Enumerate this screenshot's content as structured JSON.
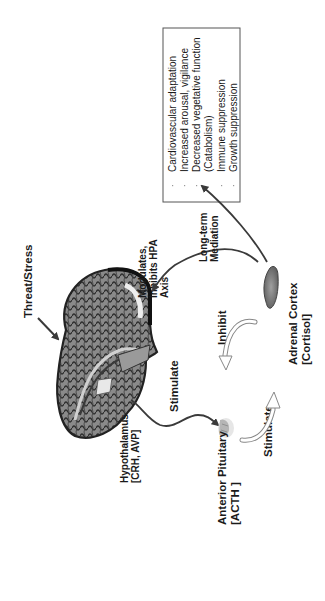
{
  "diagram": {
    "orientation": "rotated-90-ccw",
    "nodes": {
      "threat": {
        "label": "Threat/Stress"
      },
      "hypothalamus": {
        "label_line1": "Hypothalamus",
        "label_line2": "[CRH, AVP]"
      },
      "pituitary": {
        "label_line1": "Anterior Pituitary",
        "label_line2": "[ACTH ]"
      },
      "adrenal": {
        "label_line1": "Adrenal Cortex",
        "label_line2": "[Cortisol]"
      }
    },
    "edges": {
      "stimulate_upper": "Stimulate",
      "stimulate_lower": "Stimulate",
      "inhibit": "Inhibit",
      "modulates": {
        "line1": "Modulates,",
        "line2": "Inhibits HPA",
        "line3": "Axis"
      },
      "long_term": {
        "line1": "Long-term",
        "line2": "Mediation"
      }
    },
    "effects_box": {
      "items": [
        "Cardiovascular adaptation",
        "Increased arousal, vigilance",
        "Decreased vegetative function",
        "(Catabolism)",
        "Immune suppression",
        "Growth suppression"
      ],
      "bullet_visible": [
        true,
        true,
        true,
        false,
        true,
        true
      ]
    },
    "colors": {
      "text": "#1a1a1a",
      "arrow": "#3a3a3a",
      "box_border": "#555555",
      "brain_dark": "#2b2b2b",
      "brain_mid": "#7a7a7a",
      "brain_light": "#b8b8b8",
      "adrenal": "#8a8a8a"
    }
  }
}
